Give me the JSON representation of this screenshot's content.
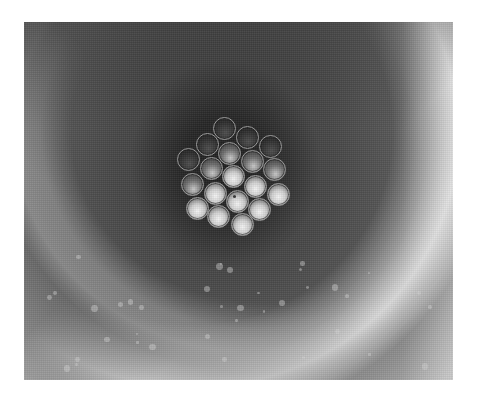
{
  "image": {
    "subject": "bundle of 19 circular tubes/fibers viewed end-on inside a larger tube",
    "colors": {
      "background": "#ffffff",
      "tube_center": "#1e1e1e",
      "tube_wall": "#6a6a6a",
      "highlight_arc": "#e0e0e0",
      "fiber_rim": "#9a9a9a",
      "fiber_bright": "#f4f4f4"
    },
    "photo_bounds": {
      "x": 24,
      "y": 22,
      "width": 429,
      "height": 358
    },
    "fiber_radius": 11.5,
    "fibers": [
      {
        "x": 224,
        "y": 128,
        "tone": "dark"
      },
      {
        "x": 247,
        "y": 137,
        "tone": "dark"
      },
      {
        "x": 207,
        "y": 144,
        "tone": "dark"
      },
      {
        "x": 270,
        "y": 146,
        "tone": "dark"
      },
      {
        "x": 229,
        "y": 153,
        "tone": "mid"
      },
      {
        "x": 188,
        "y": 159,
        "tone": "dark"
      },
      {
        "x": 252,
        "y": 161,
        "tone": "mid"
      },
      {
        "x": 211,
        "y": 168,
        "tone": "mid"
      },
      {
        "x": 274,
        "y": 169,
        "tone": "mid"
      },
      {
        "x": 233,
        "y": 176,
        "tone": "bright"
      },
      {
        "x": 192,
        "y": 184,
        "tone": "mid"
      },
      {
        "x": 255,
        "y": 186,
        "tone": "bright"
      },
      {
        "x": 215,
        "y": 193,
        "tone": "bright"
      },
      {
        "x": 278,
        "y": 194,
        "tone": "bright"
      },
      {
        "x": 237,
        "y": 201,
        "tone": "bright"
      },
      {
        "x": 197,
        "y": 208,
        "tone": "bright"
      },
      {
        "x": 259,
        "y": 209,
        "tone": "bright"
      },
      {
        "x": 218,
        "y": 216,
        "tone": "bright"
      },
      {
        "x": 242,
        "y": 224,
        "tone": "bright"
      }
    ]
  }
}
